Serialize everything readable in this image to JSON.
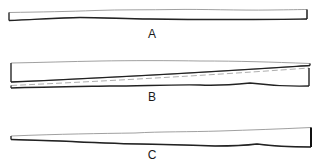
{
  "figure": {
    "stroke_color": "#222222",
    "fill_color": "#ffffff",
    "shapes": [
      {
        "id": "A",
        "label": "A",
        "form": "uniform-width strip with slightly wavy edges"
      },
      {
        "id": "B",
        "label": "B",
        "form": "strip split diagonally into two tapering wedges"
      },
      {
        "id": "C",
        "label": "C",
        "form": "tapered strip, narrow at left, wide at right"
      }
    ]
  }
}
